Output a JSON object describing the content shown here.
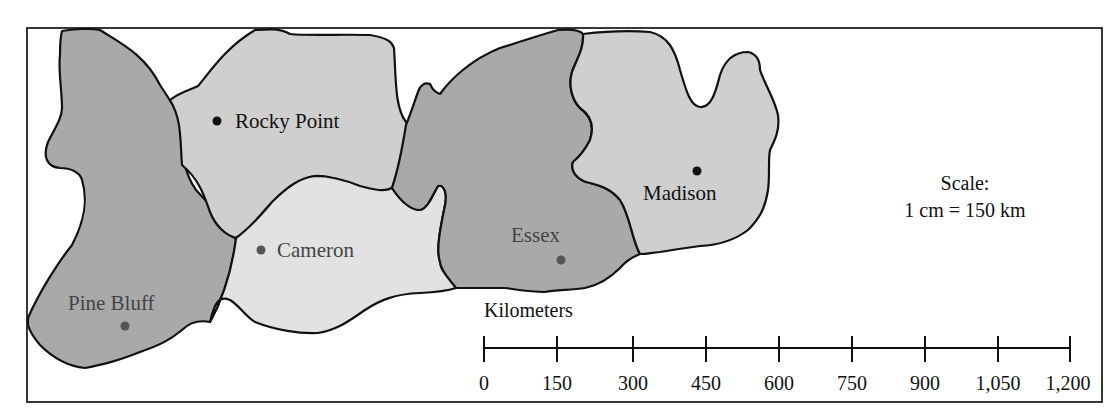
{
  "map": {
    "title": "",
    "regions": [
      {
        "name": "Pine Bluff",
        "shade": "dark",
        "fill": "#a9a9a9"
      },
      {
        "name": "Rocky Point",
        "shade": "mid",
        "fill": "#cfcfcf"
      },
      {
        "name": "Cameron",
        "shade": "light",
        "fill": "#e2e2e2"
      },
      {
        "name": "Essex",
        "shade": "dark",
        "fill": "#a9a9a9"
      },
      {
        "name": "Madison",
        "shade": "mid",
        "fill": "#cfcfcf"
      }
    ],
    "cities": [
      {
        "label": "Rocky Point",
        "dot_color": "#111111"
      },
      {
        "label": "Cameron",
        "dot_color": "#555555"
      },
      {
        "label": "Pine Bluff",
        "dot_color": "#555555"
      },
      {
        "label": "Essex",
        "dot_color": "#555555"
      },
      {
        "label": "Madison",
        "dot_color": "#111111"
      }
    ],
    "scale_note": {
      "line1": "Scale:",
      "line2": "1 cm = 150 km"
    },
    "scale_bar": {
      "title": "Kilometers",
      "ticks": [
        "0",
        "150",
        "300",
        "450",
        "600",
        "750",
        "900",
        "1,050",
        "1,200"
      ]
    }
  }
}
